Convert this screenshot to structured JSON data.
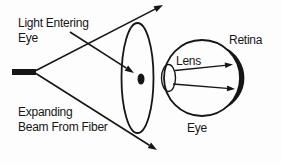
{
  "diagram": {
    "type": "optics-schematic",
    "labels": {
      "light_entering_line1": "Light Entering",
      "light_entering_line2": "Eye",
      "expanding_line1": "Expanding",
      "expanding_line2": "Beam From Fiber",
      "retina": "Retina",
      "lens": "Lens",
      "eye": "Eye"
    },
    "colors": {
      "ink": "#161616",
      "background": "#fdfdfd"
    }
  }
}
